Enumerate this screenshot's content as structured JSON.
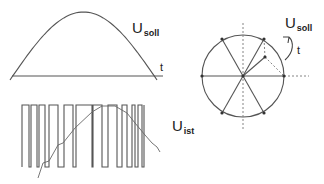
{
  "diagram": {
    "colors": {
      "line": "#555555",
      "text": "#222222",
      "dashed": "#666666",
      "dot": "#333333"
    },
    "top_plot": {
      "label_main": "U",
      "label_sub": "soll",
      "axis_label": "t",
      "axis": {
        "x1": 12,
        "x2": 163,
        "y": 76
      },
      "sine": {
        "x_start": 10,
        "x_end": 157,
        "y_base": 80,
        "peak_y": 12
      }
    },
    "bottom_plot": {
      "label_main": "U",
      "label_sub": "ist",
      "top_y": 105,
      "bottom_y": 167,
      "start_x": 22,
      "high_segments": [
        [
          22,
          29
        ],
        [
          31,
          37
        ],
        [
          39,
          45
        ],
        [
          49,
          58
        ],
        [
          64,
          73
        ],
        [
          76,
          92
        ],
        [
          93,
          102
        ],
        [
          108,
          117
        ],
        [
          122,
          127
        ],
        [
          132,
          135
        ],
        [
          138,
          142
        ]
      ],
      "end_x": 144,
      "ist_curve": [
        [
          38,
          178
        ],
        [
          43,
          163
        ],
        [
          49,
          161
        ],
        [
          58,
          145
        ],
        [
          63,
          143
        ],
        [
          75,
          128
        ],
        [
          92,
          112
        ],
        [
          102,
          106
        ],
        [
          115,
          106
        ],
        [
          127,
          113
        ],
        [
          135,
          123
        ],
        [
          145,
          135
        ],
        [
          152,
          143
        ],
        [
          157,
          147
        ],
        [
          160,
          152
        ]
      ]
    },
    "phasor": {
      "label_main": "U",
      "label_sub": "soll",
      "rotation_label": "t",
      "center": [
        243,
        76
      ],
      "radius": 41,
      "vertex_dots": [
        [
          202,
          76
        ],
        [
          222,
          39
        ],
        [
          264,
          39
        ],
        [
          284,
          76
        ],
        [
          264,
          113
        ],
        [
          222,
          113
        ]
      ],
      "inner_point": [
        265,
        57
      ]
    }
  }
}
